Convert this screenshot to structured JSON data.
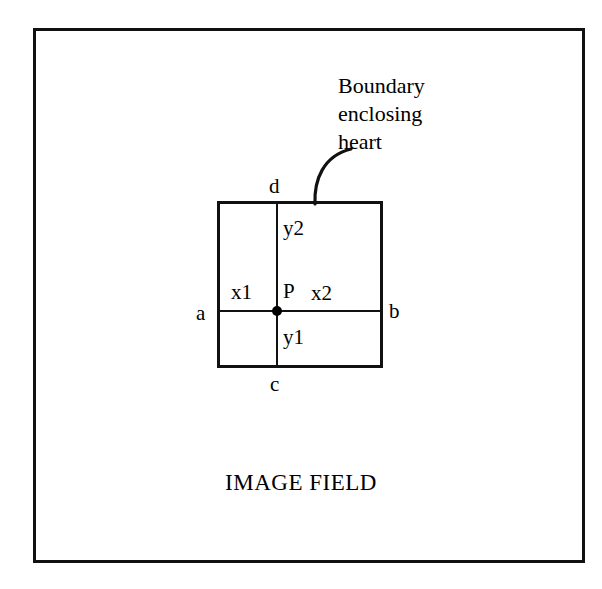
{
  "diagram": {
    "caption": "IMAGE FIELD",
    "annotation": "Boundary\nenclosing\nheart",
    "annotation_lines": [
      "Boundary",
      "enclosing",
      "heart"
    ],
    "colors": {
      "stroke": "#111111",
      "background": "#ffffff",
      "point_fill": "#000000"
    },
    "edge_labels": {
      "top": "d",
      "bottom": "c",
      "left": "a",
      "right": "b"
    },
    "interior_labels": {
      "point": "P",
      "left_segment": "x1",
      "right_segment": "x2",
      "upper_segment": "y2",
      "lower_segment": "y1"
    }
  }
}
